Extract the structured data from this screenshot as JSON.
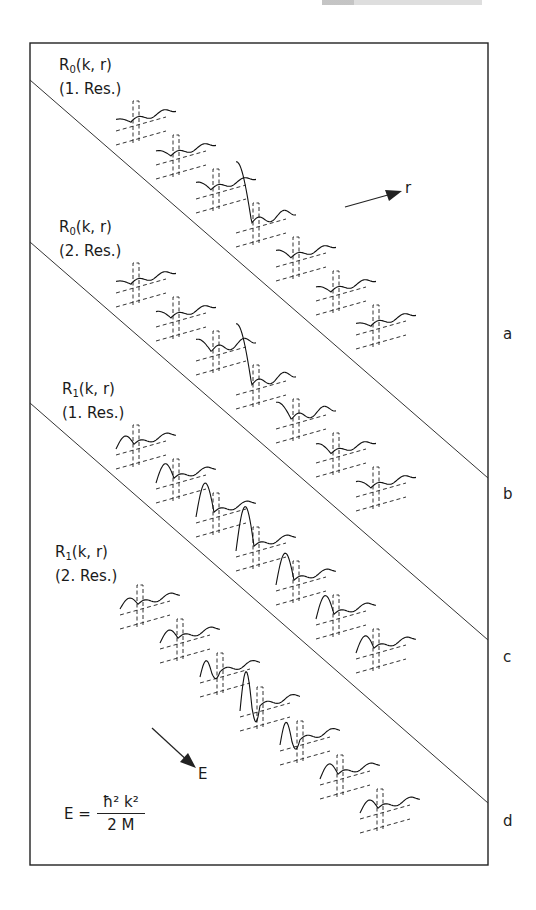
{
  "figure": {
    "panels": [
      {
        "id": "a",
        "function": "R",
        "l": "0",
        "args": "(k, r)",
        "resonance": "(1. Res.)",
        "band_label": "a"
      },
      {
        "id": "b",
        "function": "R",
        "l": "0",
        "args": "(k, r)",
        "resonance": "(2. Res.)",
        "band_label": "b"
      },
      {
        "id": "c",
        "function": "R",
        "l": "1",
        "args": "(k, r)",
        "resonance": "(1. Res.)",
        "band_label": "c"
      },
      {
        "id": "d",
        "function": "R",
        "l": "1",
        "args": "(k, r)",
        "resonance": "(2. Res.)",
        "band_label": "d"
      }
    ],
    "axis_arrows": {
      "r_label": "r",
      "E_label": "E"
    },
    "formula": {
      "lhs": "E =",
      "numerator": "ħ² k²",
      "denominator": "2 M"
    }
  },
  "chart_data": {
    "type": "line",
    "title": "",
    "xlabel": "r",
    "ylabel": "R_l(k, r)",
    "stack_direction_label": "E",
    "stack_relation": "E = ħ² k² / 2M",
    "panels": [
      {
        "name": "R_0(k,r) (1. Res.)",
        "band": "a",
        "curves": [
          {
            "index": 1,
            "shape": "dip",
            "amplitude": 0.3
          },
          {
            "index": 2,
            "shape": "dip",
            "amplitude": 0.4
          },
          {
            "index": 3,
            "shape": "dip",
            "amplitude": 0.5
          },
          {
            "index": 4,
            "shape": "dip",
            "amplitude": 1.6
          },
          {
            "index": 5,
            "shape": "dip",
            "amplitude": 0.5
          },
          {
            "index": 6,
            "shape": "dip",
            "amplitude": 0.4
          },
          {
            "index": 7,
            "shape": "dip",
            "amplitude": 0.3
          }
        ]
      },
      {
        "name": "R_0(k,r) (2. Res.)",
        "band": "b",
        "curves": [
          {
            "index": 1,
            "shape": "dip",
            "amplitude": 0.3
          },
          {
            "index": 2,
            "shape": "dip",
            "amplitude": 0.45
          },
          {
            "index": 3,
            "shape": "dip",
            "amplitude": 0.7
          },
          {
            "index": 4,
            "shape": "dip",
            "amplitude": 1.6
          },
          {
            "index": 5,
            "shape": "dip",
            "amplitude": 0.9
          },
          {
            "index": 6,
            "shape": "dip",
            "amplitude": 0.6
          },
          {
            "index": 7,
            "shape": "dip",
            "amplitude": 0.45
          }
        ]
      },
      {
        "name": "R_1(k,r) (1. Res.)",
        "band": "c",
        "curves": [
          {
            "index": 1,
            "shape": "peak",
            "amplitude": 0.25
          },
          {
            "index": 2,
            "shape": "peak",
            "amplitude": 0.4
          },
          {
            "index": 3,
            "shape": "peak",
            "amplitude": 0.75
          },
          {
            "index": 4,
            "shape": "peak",
            "amplitude": 1.0
          },
          {
            "index": 5,
            "shape": "peak",
            "amplitude": 0.7
          },
          {
            "index": 6,
            "shape": "peak",
            "amplitude": 0.5
          },
          {
            "index": 7,
            "shape": "peak",
            "amplitude": 0.35
          }
        ]
      },
      {
        "name": "R_1(k,r) (2. Res.)",
        "band": "d",
        "curves": [
          {
            "index": 1,
            "shape": "peak",
            "amplitude": 0.2
          },
          {
            "index": 2,
            "shape": "peak",
            "amplitude": 0.25
          },
          {
            "index": 3,
            "shape": "peak-dip",
            "amplitude": 0.35
          },
          {
            "index": 4,
            "shape": "peak-dip",
            "amplitude": 0.9
          },
          {
            "index": 5,
            "shape": "peak-dip",
            "amplitude": 0.5
          },
          {
            "index": 6,
            "shape": "peak",
            "amplitude": 0.3
          },
          {
            "index": 7,
            "shape": "peak",
            "amplitude": 0.25
          }
        ]
      }
    ]
  }
}
